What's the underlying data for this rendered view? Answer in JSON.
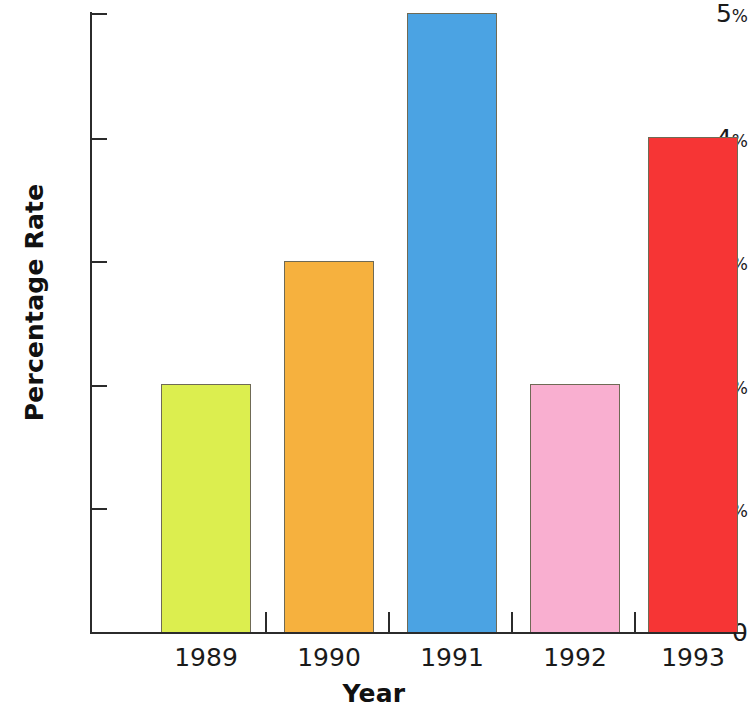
{
  "chart_data": {
    "type": "bar",
    "title": "",
    "subtitle": "",
    "xlabel": "Year",
    "ylabel": "Percentage Rate",
    "categories": [
      "1989",
      "1990",
      "1991",
      "1992",
      "1993"
    ],
    "values": [
      2,
      3,
      5,
      2,
      4
    ],
    "value_labels": [
      "2%",
      "3%",
      "5%",
      "2%",
      "4%"
    ],
    "ylim": [
      0,
      5
    ],
    "y_ticks": [
      0,
      1,
      2,
      3,
      4,
      5
    ],
    "y_tick_labels": [
      "0",
      "1%",
      "2%",
      "3%",
      "4%",
      "5%"
    ],
    "grid": false,
    "legend": false,
    "legend_position": "none",
    "series": [
      {
        "name": "Percentage Rate",
        "values": [
          2,
          3,
          5,
          2,
          4
        ],
        "colors": [
          "#dcee4f",
          "#f6b13e",
          "#4ba3e3",
          "#f9afd0",
          "#f63535"
        ]
      }
    ],
    "bar_colors": {
      "1989": "#dcee4f",
      "1990": "#f6b13e",
      "1991": "#4ba3e3",
      "1992": "#f9afd0",
      "1993": "#f63535"
    },
    "bar_border_color": "#6f6a55",
    "axis_color": "#2b2b2b",
    "text_color": "#1a1a1a",
    "background": "#ffffff"
  }
}
